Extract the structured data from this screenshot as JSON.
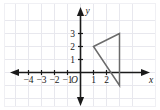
{
  "figure": {
    "background_color": "#ffffff",
    "grid_color": "#e8e8ee",
    "frame_color": "#f0f0f4",
    "axis_color": "#1a1a1a",
    "shape_color": "#6b6b6b"
  },
  "axes": {
    "x_label": "x",
    "y_label": "y",
    "origin_label": "O",
    "x_ticks": [
      {
        "value": -4,
        "label": "−4"
      },
      {
        "value": -3,
        "label": "−3"
      },
      {
        "value": -2,
        "label": "−2"
      },
      {
        "value": -1,
        "label": "−1"
      },
      {
        "value": 1,
        "label": "1"
      },
      {
        "value": 2,
        "label": "2"
      }
    ],
    "y_ticks": [
      {
        "value": 1,
        "label": "1"
      },
      {
        "value": 2,
        "label": "2"
      },
      {
        "value": 3,
        "label": "3"
      }
    ],
    "x_range": [
      -5,
      4
    ],
    "y_range": [
      -2,
      4
    ]
  },
  "chart_data": {
    "type": "scatter",
    "xlabel": "x",
    "ylabel": "y",
    "xlim": [
      -5,
      4
    ],
    "ylim": [
      -2,
      4
    ],
    "grid": true,
    "legend": "none",
    "shapes": [
      {
        "name": "triangle",
        "kind": "polygon",
        "closed": true,
        "stroke": "#6b6b6b",
        "fill": "none",
        "vertices": [
          {
            "x": 1,
            "y": 2
          },
          {
            "x": 3,
            "y": 3
          },
          {
            "x": 3,
            "y": -1
          }
        ]
      }
    ]
  }
}
